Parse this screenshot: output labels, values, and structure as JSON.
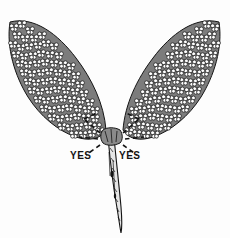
{
  "figure": {
    "background_color": "#fdfdfd",
    "ink_color": "#141414",
    "width": 230,
    "height": 238
  },
  "labels": {
    "left": {
      "text": "YES",
      "x": 70,
      "y": 150
    },
    "right": {
      "text": "YES",
      "x": 119,
      "y": 150
    }
  },
  "parts": {
    "left_leaf": {
      "name": "left-leaflet-cluster",
      "tip_x": 10,
      "tip_y": 22,
      "base_x": 104,
      "base_y": 136
    },
    "right_leaf": {
      "name": "right-leaflet-cluster",
      "tip_x": 219,
      "tip_y": 22,
      "base_x": 126,
      "base_y": 136
    },
    "stem": {
      "name": "petiole-stem",
      "top_x": 113,
      "top_y": 136,
      "tip_x": 120,
      "tip_y": 233
    },
    "junction": {
      "name": "leaf-junction-node",
      "x": 112,
      "y": 139
    }
  },
  "cut_marks": {
    "name": "dashed-cut-indicators",
    "count": 6,
    "style": "dashed",
    "description": "Dashed chevron marks radiating from the stem junction indicating correct cut points"
  },
  "colors": {
    "ink": "#141414",
    "paper": "#fdfdfd",
    "mid_gray": "#6b6b6b"
  }
}
